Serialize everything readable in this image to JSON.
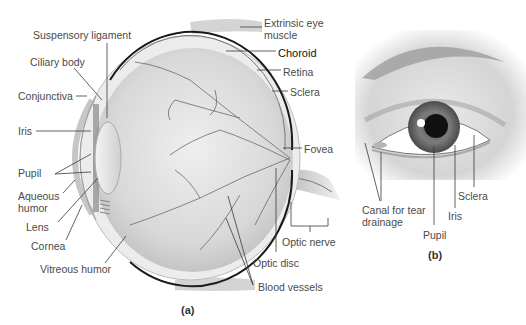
{
  "figure": {
    "panel_a": {
      "tag": "(a)",
      "title": "Sagittal section of the eyeball",
      "labels": {
        "suspensory_ligament": "Suspensory ligament",
        "ciliary_body": "Ciliary body",
        "conjunctiva": "Conjunctiva",
        "iris": "Iris",
        "pupil": "Pupil",
        "aqueous_humor_1": "Aqueous",
        "aqueous_humor_2": "humor",
        "lens": "Lens",
        "cornea": "Cornea",
        "vitreous_humor": "Vitreous humor",
        "extrinsic_muscle_1": "Extrinsic eye",
        "extrinsic_muscle_2": "muscle",
        "choroid": "Choroid",
        "retina": "Retina",
        "sclera": "Sclera",
        "fovea": "Fovea",
        "optic_nerve": "Optic nerve",
        "optic_disc": "Optic disc",
        "blood_vessels": "Blood vessels"
      }
    },
    "panel_b": {
      "tag": "(b)",
      "title": "External view of the eye",
      "labels": {
        "canal_1": "Canal for tear",
        "canal_2": "drainage",
        "pupil": "Pupil",
        "iris": "Iris",
        "sclera": "Sclera"
      }
    },
    "colors": {
      "line": "#3a3a3a",
      "choroid": "#1a1a1a",
      "eyeball_fill": "#dcdcdc",
      "vessel": "#6a6a6a"
    }
  }
}
